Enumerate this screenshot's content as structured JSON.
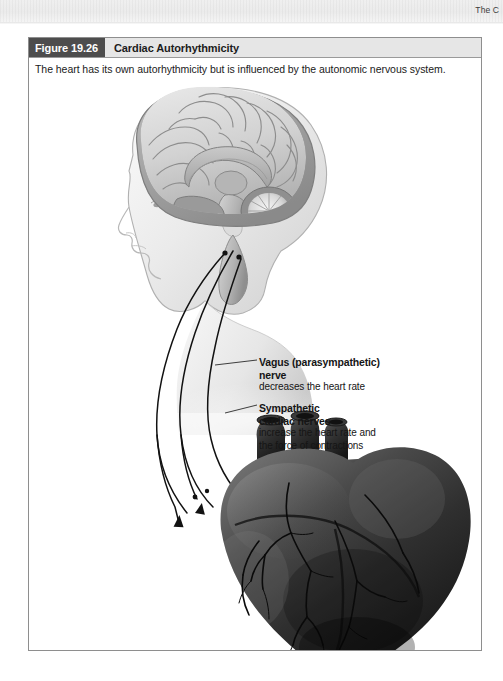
{
  "page": {
    "running_header": "The C",
    "background_color": "#ffffff",
    "scan_band_color": "#eeeeee"
  },
  "figure": {
    "number_label": "Figure 19.26",
    "title": "Cardiac Autorhythmicity",
    "caption": "The heart has its own autorhythmicity but is influenced by the autonomic nervous system.",
    "badge_color": "#4d4d4d",
    "titlebar_color": "#e6e6e6",
    "border_color": "#8e8e8e"
  },
  "illustration": {
    "description": "Grayscale medical illustration: sagittal section of a human head showing the brain, with two long nerve pathways descending to a heart below.",
    "parts": [
      {
        "name": "head-sagittal-section",
        "label": ""
      },
      {
        "name": "cerebrum",
        "label": ""
      },
      {
        "name": "corpus-callosum",
        "label": ""
      },
      {
        "name": "cerebellum",
        "label": ""
      },
      {
        "name": "brainstem",
        "label": ""
      },
      {
        "name": "heart",
        "label": ""
      },
      {
        "name": "coronary-vessels",
        "label": ""
      },
      {
        "name": "vagus-nerve-pathway",
        "label": ""
      },
      {
        "name": "sympathetic-nerve-pathway",
        "label": ""
      }
    ]
  },
  "annotations": [
    {
      "id": "vagus",
      "title_line1": "Vagus (parasympathetic)",
      "title_line2": "nerve",
      "body_line1": "decreases the heart rate",
      "body_line2": ""
    },
    {
      "id": "sympathetic",
      "title_line1": "Sympathetic",
      "title_line2": "cardiac nerves",
      "body_line1": "increase the heart rate and",
      "body_line2": "the force of contractions"
    }
  ]
}
